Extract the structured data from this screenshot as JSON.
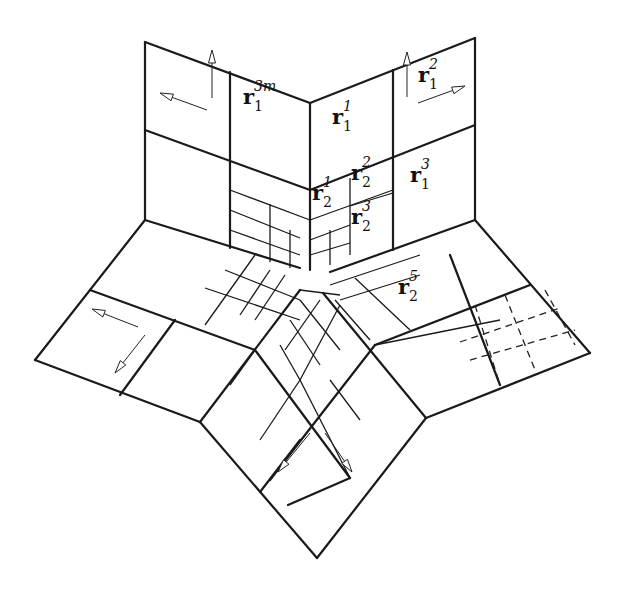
{
  "diagram": {
    "labels": [
      {
        "id": "r1_3m",
        "base": "r",
        "sub": "1",
        "sup": "3m",
        "x": 253,
        "y": 100
      },
      {
        "id": "r1_1",
        "base": "r",
        "sub": "1",
        "sup": "1",
        "x": 342,
        "y": 120
      },
      {
        "id": "r1_2",
        "base": "r",
        "sub": "1",
        "sup": "2",
        "x": 428,
        "y": 78
      },
      {
        "id": "r1_3",
        "base": "r",
        "sub": "1",
        "sup": "3",
        "x": 420,
        "y": 178
      },
      {
        "id": "r2_1",
        "base": "r",
        "sub": "2",
        "sup": "1",
        "x": 322,
        "y": 196
      },
      {
        "id": "r2_2",
        "base": "r",
        "sub": "2",
        "sup": "2",
        "x": 361,
        "y": 176
      },
      {
        "id": "r2_3",
        "base": "r",
        "sub": "2",
        "sup": "3",
        "x": 361,
        "y": 220
      },
      {
        "id": "r2_5",
        "base": "r",
        "sub": "2",
        "sup": "5",
        "x": 408,
        "y": 290
      }
    ],
    "thick_lines": [
      [
        145,
        42,
        310,
        103
      ],
      [
        310,
        103,
        475,
        38
      ],
      [
        145,
        42,
        145,
        220
      ],
      [
        475,
        38,
        475,
        220
      ],
      [
        310,
        103,
        310,
        270
      ],
      [
        145,
        220,
        300,
        268
      ],
      [
        475,
        220,
        330,
        272
      ],
      [
        145,
        220,
        35,
        360
      ],
      [
        35,
        360,
        200,
        422
      ],
      [
        200,
        422,
        300,
        290
      ],
      [
        475,
        220,
        590,
        353
      ],
      [
        590,
        353,
        426,
        418
      ],
      [
        426,
        418,
        323,
        293
      ],
      [
        200,
        422,
        317,
        558
      ],
      [
        317,
        558,
        426,
        418
      ],
      [
        145,
        130,
        310,
        190
      ],
      [
        310,
        190,
        475,
        125
      ],
      [
        230,
        72,
        230,
        248
      ],
      [
        393,
        70,
        393,
        250
      ],
      [
        90,
        290,
        255,
        350
      ],
      [
        175,
        320,
        120,
        395
      ],
      [
        255,
        350,
        350,
        478
      ],
      [
        350,
        478,
        288,
        505
      ],
      [
        530,
        285,
        375,
        345
      ],
      [
        450,
        255,
        500,
        385
      ],
      [
        375,
        345,
        270,
        480
      ],
      [
        260,
        492,
        300,
        440
      ]
    ],
    "thin_lines": [
      [
        230,
        190,
        310,
        220
      ],
      [
        310,
        220,
        393,
        190
      ],
      [
        350,
        178,
        350,
        255
      ],
      [
        350,
        206,
        393,
        193
      ],
      [
        230,
        210,
        300,
        238
      ],
      [
        270,
        204,
        270,
        262
      ],
      [
        290,
        230,
        290,
        268
      ],
      [
        230,
        230,
        300,
        255
      ],
      [
        310,
        240,
        350,
        225
      ],
      [
        330,
        230,
        330,
        265
      ],
      [
        310,
        255,
        350,
        243
      ],
      [
        205,
        288,
        300,
        320
      ],
      [
        255,
        255,
        205,
        325
      ],
      [
        225,
        270,
        300,
        300
      ],
      [
        270,
        270,
        240,
        315
      ],
      [
        285,
        275,
        255,
        320
      ],
      [
        330,
        285,
        420,
        255
      ],
      [
        355,
        278,
        410,
        330
      ],
      [
        340,
        300,
        420,
        275
      ],
      [
        335,
        300,
        370,
        340
      ],
      [
        375,
        345,
        500,
        320
      ],
      [
        300,
        300,
        340,
        350
      ],
      [
        290,
        320,
        320,
        365
      ],
      [
        280,
        345,
        300,
        380
      ],
      [
        340,
        305,
        300,
        380
      ],
      [
        320,
        300,
        285,
        350
      ],
      [
        300,
        380,
        260,
        440
      ],
      [
        330,
        380,
        360,
        420
      ],
      [
        300,
        290,
        340,
        295
      ],
      [
        255,
        350,
        230,
        385
      ],
      [
        300,
        380,
        350,
        478
      ]
    ],
    "dashed_lines": [
      [
        475,
        305,
        500,
        385
      ],
      [
        505,
        295,
        535,
        370
      ],
      [
        460,
        342,
        560,
        308
      ],
      [
        470,
        360,
        575,
        330
      ],
      [
        545,
        290,
        575,
        345
      ]
    ],
    "arrows": [
      {
        "id": "frame-top-left-up",
        "x1": 212,
        "y1": 98,
        "x2": 212,
        "y2": 50
      },
      {
        "id": "frame-top-left-left",
        "x1": 207,
        "y1": 110,
        "x2": 160,
        "y2": 93
      },
      {
        "id": "frame-top-right-up",
        "x1": 407,
        "y1": 97,
        "x2": 407,
        "y2": 52
      },
      {
        "id": "frame-top-right-right",
        "x1": 418,
        "y1": 103,
        "x2": 465,
        "y2": 86
      },
      {
        "id": "frame-left-left",
        "x1": 138,
        "y1": 327,
        "x2": 92,
        "y2": 309
      },
      {
        "id": "frame-left-down",
        "x1": 145,
        "y1": 335,
        "x2": 115,
        "y2": 373
      },
      {
        "id": "frame-bottom-left",
        "x1": 310,
        "y1": 433,
        "x2": 278,
        "y2": 472
      },
      {
        "id": "frame-bottom-right",
        "x1": 325,
        "y1": 433,
        "x2": 352,
        "y2": 472
      }
    ]
  }
}
